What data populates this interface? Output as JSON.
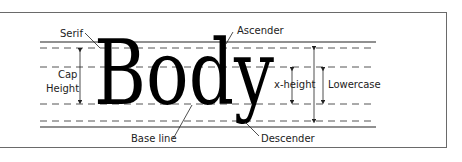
{
  "diagram": {
    "word": "Body",
    "labels": {
      "serif": "Serif",
      "ascender": "Ascender",
      "cap": "Cap",
      "height": "Height",
      "x_height": "x-height",
      "lowercase": "Lowercase",
      "base_line": "Base line",
      "descender": "Descender"
    },
    "colors": {
      "line": "#222222",
      "dash": "#555555",
      "frame": "#6a6a6a",
      "text": "#000000"
    }
  }
}
